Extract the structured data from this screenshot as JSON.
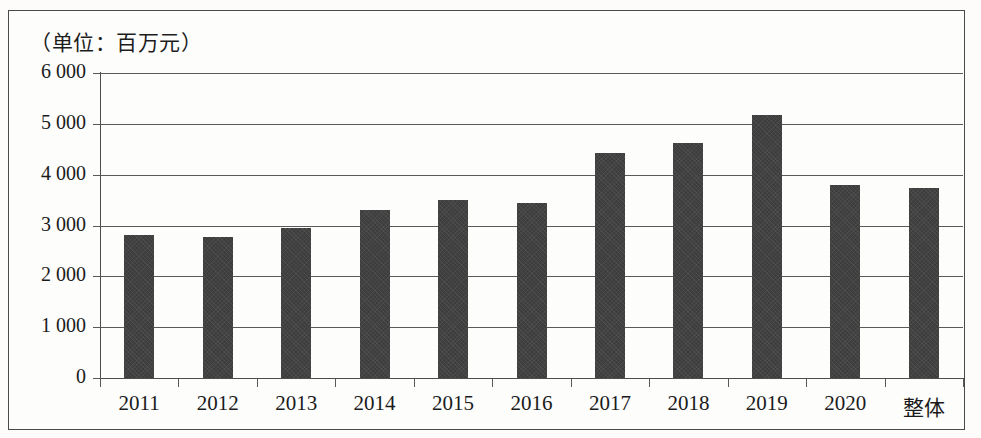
{
  "figure": {
    "unit_caption": "（单位：百万元）",
    "background_color": "#fdfdfc",
    "bar_color": "#3d3d3d",
    "axis_color": "#4d4d4d",
    "grid_color": "#5a5a5a"
  },
  "chart_data": {
    "type": "bar",
    "title": "",
    "subtitle": "",
    "annotations": [
      "（单位：百万元）"
    ],
    "xlabel": "",
    "ylabel": "",
    "unit": "百万元",
    "categories": [
      "2011",
      "2012",
      "2013",
      "2014",
      "2015",
      "2016",
      "2017",
      "2018",
      "2019",
      "2020",
      "整体"
    ],
    "values": [
      2820,
      2770,
      2950,
      3310,
      3500,
      3450,
      4430,
      4620,
      5180,
      3790,
      3730
    ],
    "ylim": [
      0,
      6000
    ],
    "yticks": [
      0,
      1000,
      2000,
      3000,
      4000,
      5000,
      6000
    ],
    "ytick_labels": [
      "0",
      "1 000",
      "2 000",
      "3 000",
      "4 000",
      "5 000",
      "6 000"
    ],
    "grid": true,
    "grid_axis": "y",
    "legend": false,
    "legend_position": "none"
  }
}
